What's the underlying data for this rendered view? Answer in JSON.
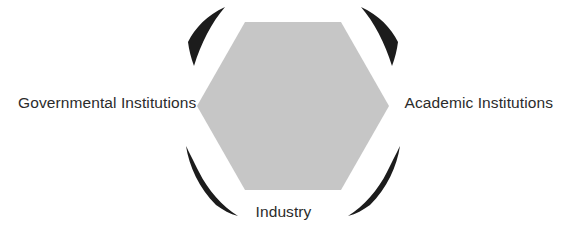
{
  "figure": {
    "type": "triad-hexagon-diagram",
    "background_color": "#ffffff",
    "title": "",
    "center_shape": {
      "name": "hexagon",
      "fill_color": "#c6c6c6",
      "orientation": "pointy-left-right"
    },
    "arc_color": "#1c1c1c",
    "text_color": "#2b2b2b",
    "labels": {
      "left": "Governmental Institutions",
      "right": "Academic Institutions",
      "bottom": "Industry"
    },
    "arcs": [
      {
        "name": "top-left-arc",
        "weight": "thin"
      },
      {
        "name": "top-right-arc",
        "weight": "thin"
      },
      {
        "name": "bottom-left-arc",
        "weight": "thick"
      },
      {
        "name": "bottom-right-arc",
        "weight": "thick"
      }
    ]
  }
}
